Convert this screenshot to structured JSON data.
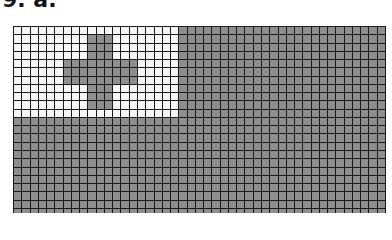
{
  "label": "9. a.",
  "figure": {
    "grid": {
      "columns": 45,
      "rows_visible": 23
    },
    "canton": {
      "col_start": 0,
      "col_end": 20,
      "row_start": 0,
      "row_end": 11,
      "color": "#f6f6f6"
    },
    "cross": {
      "color": "#8e8e8e",
      "vertical_arm": {
        "col_start": 9,
        "col_end": 12,
        "row_start": 1,
        "row_end": 10
      },
      "horizontal_arm": {
        "col_start": 6,
        "col_end": 15,
        "row_start": 4,
        "row_end": 7
      }
    },
    "field_color": "#8e8e8e",
    "gridline_color": "#1a1a1a"
  }
}
